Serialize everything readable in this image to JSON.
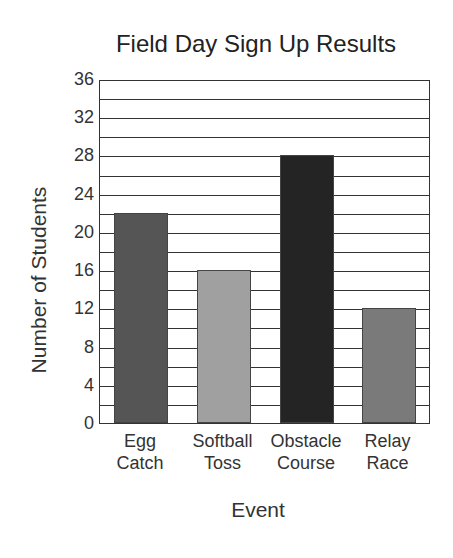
{
  "chart_data": {
    "type": "bar",
    "title": "Field Day Sign Up Results",
    "xlabel": "Event",
    "ylabel": "Number of Students",
    "categories": [
      "Egg Catch",
      "Softball Toss",
      "Obstacle Course",
      "Relay Race"
    ],
    "category_lines": [
      [
        "Egg",
        "Catch"
      ],
      [
        "Softball",
        "Toss"
      ],
      [
        "Obstacle",
        "Course"
      ],
      [
        "Relay",
        "Race"
      ]
    ],
    "values": [
      22,
      16,
      28,
      12
    ],
    "colors": [
      "#555555",
      "#a0a0a0",
      "#242424",
      "#7a7a7a"
    ],
    "ylim": [
      0,
      36
    ],
    "yticks": [
      0,
      4,
      8,
      12,
      16,
      20,
      24,
      28,
      32,
      36
    ],
    "grid": true,
    "grid_step": 2,
    "legend": null
  }
}
